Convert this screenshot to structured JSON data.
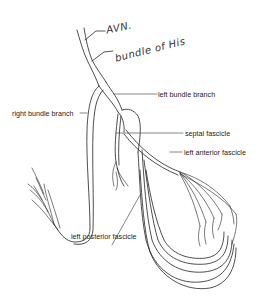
{
  "diagram": {
    "type": "anatomical line drawing - cardiac conduction system",
    "handwritten_annotations": {
      "avn": "AVN.",
      "bundle_of_his": "bundle of His"
    },
    "labels": {
      "left_bundle_branch": "left bundle branch",
      "right_bundle_branch": "right bundle branch",
      "septal_fascicle": "septal fascicle",
      "left_anterior_fascicle": "left anterior fascicle",
      "left_posterior_fascicle": "left posterior fascicle"
    },
    "colors": {
      "line": "#222222",
      "background": "#ffffff"
    }
  }
}
